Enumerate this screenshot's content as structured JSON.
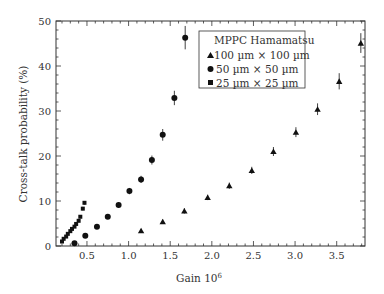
{
  "chart_data": {
    "type": "scatter",
    "title": "",
    "xlabel": "Gain 10",
    "xlabel_sup": "6",
    "ylabel": "Cross-talk probability (%)",
    "xlim": [
      0.128,
      3.84
    ],
    "ylim": [
      0,
      50
    ],
    "xticks": [
      0.5,
      1.0,
      1.5,
      2.0,
      2.5,
      3.0,
      3.5
    ],
    "xtick_labels": [
      "0.5",
      "1.0",
      "1.5",
      "2.0",
      "2.5",
      "3.0",
      "3.5"
    ],
    "yticks": [
      0,
      10,
      20,
      30,
      40,
      50
    ],
    "ytick_labels": [
      "0",
      "10",
      "20",
      "30",
      "40",
      "50"
    ],
    "grid": false,
    "legend": {
      "title": "MPPC Hamamatsu",
      "position": "upper-center-right"
    },
    "series": [
      {
        "name": "100 µm × 100 µm",
        "marker": "triangle",
        "x": [
          1.15,
          1.41,
          1.67,
          1.95,
          2.21,
          2.48,
          2.74,
          3.01,
          3.27,
          3.53,
          3.79
        ],
        "y": [
          3.4,
          5.4,
          7.8,
          10.8,
          13.4,
          16.8,
          21.0,
          25.3,
          30.4,
          36.6,
          45.1
        ],
        "yerr": [
          0.4,
          0.5,
          0.6,
          0.6,
          0.7,
          0.8,
          1.0,
          1.1,
          1.3,
          1.8,
          2.2
        ]
      },
      {
        "name": "50 µm × 50 µm",
        "marker": "circle",
        "x": [
          0.35,
          0.48,
          0.62,
          0.75,
          0.88,
          1.01,
          1.15,
          1.28,
          1.41,
          1.55,
          1.68
        ],
        "y": [
          0.6,
          2.3,
          4.3,
          6.5,
          9.1,
          12.2,
          14.8,
          19.1,
          24.7,
          32.9,
          46.3
        ],
        "yerr": [
          0.2,
          0.3,
          0.4,
          0.5,
          0.6,
          0.7,
          0.8,
          1.0,
          1.3,
          1.6,
          2.6
        ]
      },
      {
        "name": "25 µm × 25 µm",
        "marker": "square",
        "x": [
          0.2,
          0.22,
          0.25,
          0.27,
          0.3,
          0.32,
          0.35,
          0.37,
          0.4,
          0.42,
          0.45,
          0.47
        ],
        "y": [
          1.0,
          1.6,
          2.1,
          2.7,
          3.3,
          3.8,
          4.3,
          4.9,
          5.6,
          6.5,
          8.3,
          9.6
        ],
        "yerr": [
          0.1,
          0.1,
          0.1,
          0.2,
          0.2,
          0.2,
          0.2,
          0.3,
          0.3,
          0.3,
          0.4,
          0.4
        ]
      }
    ]
  },
  "colors": {
    "marker": "#111111",
    "axis": "#333333",
    "text": "#333333",
    "background": "#ffffff"
  }
}
